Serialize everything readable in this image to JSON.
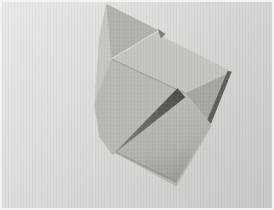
{
  "meta": {
    "type": "photograph",
    "alt": "A sheet of plain gray paper partially folded into an origami shape, lying on a plain light-gray surface",
    "width": 274,
    "height": 210
  },
  "photo": {
    "frame_color": "#f4f3f0",
    "background": {
      "top_left": "#eae9e5",
      "mid": "#dbdad6",
      "bottom_right": "#c7c7c4"
    },
    "paper": {
      "label": "folded origami paper, gray",
      "base_color": "#bfbfba",
      "darkest_shadow": "#4c4c48",
      "highlight": "#c7c7c2",
      "gradient_bottom": {
        "from": "#b9b9b4",
        "mid": "#b1b1ac",
        "to": "#9a9a95"
      },
      "gradient_wedge": {
        "from": "#8e8e89",
        "mid": "#686864",
        "to": "#4c4c48"
      },
      "facets": [
        {
          "name": "cast-shadow",
          "points": "115,154 177,188 213,126 209,124 176,184 114,153",
          "fill": "rgba(110,110,105,0.28)"
        },
        {
          "name": "paper-silhouette",
          "points": "106,2 159,29 164,36 233,71 212,124 177,184 116,153 99,138 94,106 99,35",
          "fill": "#bfbfba"
        },
        {
          "name": "left-strip-facet",
          "points": "106,2 111,58 94,100 99,35",
          "fill": "#c7c7c2"
        },
        {
          "name": "apex-facet",
          "points": "106,2 159,29 111,58",
          "fill": "#b2b2ad"
        },
        {
          "name": "upper-band-facet",
          "points": "111,58 159,29 164,36 233,71 186,93",
          "fill": "#c5c5c0"
        },
        {
          "name": "mid-facet",
          "points": "111,58 186,93 112,156 99,138 94,106",
          "fill": "#b9b9b4"
        },
        {
          "name": "right-facet",
          "points": "186,93 233,71 212,124",
          "fill": "#a7a7a2"
        },
        {
          "name": "right-edge-shadow",
          "points": "233,71 212,124 208,121 229,70",
          "fill": "#5e5e5a"
        },
        {
          "name": "bottom-facet",
          "points": "114,154 186,95 212,124 177,184",
          "fill": "url(#grad-bottom)"
        },
        {
          "name": "pocket-shadow-wedge",
          "points": "112,156 178,88 186,97",
          "fill": "url(#grad-wedge)"
        },
        {
          "name": "notch-shadow",
          "points": "158,27 166,33 161,37",
          "fill": "#7d7d78"
        },
        {
          "name": "crease-line",
          "points": "111,58 186,93",
          "fill": "none",
          "stroke": "rgba(80,80,76,0.18)",
          "stroke-width": "1"
        },
        {
          "name": "crease-highlight",
          "points": "111,58 159,29",
          "fill": "none",
          "stroke": "rgba(255,255,255,0.30)",
          "stroke-width": "1"
        },
        {
          "name": "bottom-edge-shade",
          "points": "116,153 177,184",
          "fill": "none",
          "stroke": "rgba(90,90,86,0.25)",
          "stroke-width": "1.5"
        }
      ]
    }
  }
}
